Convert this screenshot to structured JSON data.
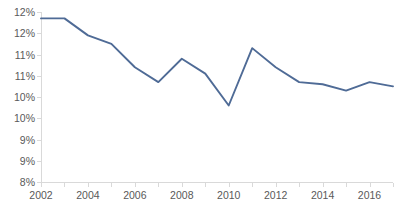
{
  "chart_data": {
    "type": "line",
    "title": "",
    "xlabel": "",
    "ylabel": "",
    "x": [
      2002,
      2003,
      2004,
      2005,
      2006,
      2007,
      2008,
      2009,
      2010,
      2011,
      2012,
      2013,
      2014,
      2015,
      2016,
      2017
    ],
    "series": [
      {
        "name": "rate",
        "values": [
          12.35,
          12.35,
          11.95,
          11.75,
          11.2,
          10.85,
          11.4,
          11.05,
          10.3,
          11.65,
          11.2,
          10.85,
          10.8,
          10.65,
          10.85,
          10.75
        ]
      }
    ],
    "xlim": [
      2002,
      2017
    ],
    "ylim": [
      8.5,
      12.5
    ],
    "y_ticks": [
      12.5,
      12.0,
      11.5,
      11.0,
      10.5,
      10.0,
      9.5,
      9.0,
      8.5
    ],
    "y_tick_labels": [
      "12%",
      "12%",
      "11%",
      "11%",
      "10%",
      "10%",
      "9%",
      "9%",
      "8%"
    ],
    "x_ticks": [
      2002,
      2003,
      2004,
      2005,
      2006,
      2007,
      2008,
      2009,
      2010,
      2011,
      2012,
      2013,
      2014,
      2015,
      2016,
      2017
    ],
    "x_tick_labels": [
      "2002",
      "",
      "2004",
      "",
      "2006",
      "",
      "2008",
      "",
      "2010",
      "",
      "2012",
      "",
      "2014",
      "",
      "2016",
      ""
    ],
    "grid": false,
    "legend": "none",
    "line_color": "#4f6b96",
    "axis_color": "#d9d9d9",
    "tick_label_color": "#595959"
  }
}
